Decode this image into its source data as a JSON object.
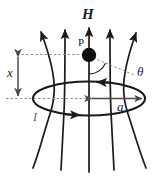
{
  "figure": {
    "background_color": "#ffffff",
    "stroke_color": "#1a1a1a",
    "guide_color": "#8c8c8c",
    "labels": {
      "field_vector": "H",
      "point": "P",
      "axial_distance": "x",
      "loop_radius": "a",
      "current": "I",
      "angle": "θ"
    },
    "elements": {
      "field_lines_count": 5,
      "loop_shape": "ellipse",
      "point_marker": "filled-circle",
      "dimension_arrows": [
        "vertical-double-arrow-x",
        "horizontal-double-arrow-a"
      ],
      "guide_lines": [
        "dashed-top-horizontal",
        "dashed-bottom-horizontal",
        "dashed-theta-leader"
      ],
      "loop_direction_arrows": [
        "left-on-far-side",
        "right-on-near-side"
      ]
    }
  }
}
